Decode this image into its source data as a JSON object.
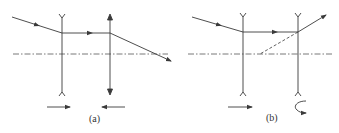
{
  "diagram": {
    "type": "optics-ray-diagram",
    "colors": {
      "stroke": "#3a3a3a",
      "background": "#ffffff"
    },
    "panels": [
      {
        "id": "a",
        "label": "(a)",
        "elements": [
          {
            "kind": "concave-lens",
            "x": 62
          },
          {
            "kind": "convex-lens",
            "x": 110
          },
          {
            "kind": "optical-axis",
            "style": "dash-dot"
          },
          {
            "kind": "incident-ray"
          },
          {
            "kind": "parallel-ray"
          },
          {
            "kind": "converging-output-ray"
          },
          {
            "kind": "motion-arrow",
            "direction": "right"
          },
          {
            "kind": "motion-arrow",
            "direction": "left"
          }
        ]
      },
      {
        "id": "b",
        "label": "(b)",
        "elements": [
          {
            "kind": "concave-lens",
            "x": 243
          },
          {
            "kind": "concave-lens",
            "x": 298
          },
          {
            "kind": "optical-axis",
            "style": "dash-dot"
          },
          {
            "kind": "incident-ray"
          },
          {
            "kind": "parallel-ray"
          },
          {
            "kind": "diverging-output-ray"
          },
          {
            "kind": "virtual-extension",
            "style": "dashed"
          },
          {
            "kind": "motion-arrow",
            "direction": "right"
          },
          {
            "kind": "rotation-arrow",
            "direction": "flip"
          }
        ]
      }
    ]
  }
}
